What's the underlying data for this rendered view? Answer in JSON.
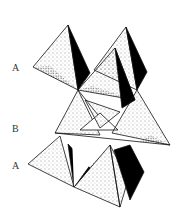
{
  "diagram": {
    "layers": [
      {
        "label": "A",
        "y": 68
      },
      {
        "label": "B",
        "y": 128
      },
      {
        "label": "A",
        "y": 165
      }
    ],
    "colors": {
      "background": "#ffffff",
      "line": "#111111",
      "shade": "#000000",
      "stipple": "#222222"
    }
  }
}
